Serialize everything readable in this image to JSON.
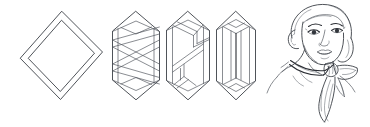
{
  "illustration": {
    "title": "Scarf folding instructions",
    "subject": "square silk scarf folded and worn as a neckerchief",
    "style": "black and white line art / technical fashion sketch",
    "background_color": "#ffffff",
    "line_color": "#3b3f46",
    "accent_line_color": "#2a2d33",
    "canvas": {
      "width": 370,
      "height": 127
    }
  },
  "steps": [
    {
      "index": 1,
      "name": "flat-square-scarf",
      "label": "Flat scarf",
      "description": "Square scarf laid flat and rotated 45 degrees into a diamond, showing the rolled hem as a second inner outline",
      "shape": "diamond",
      "bbox": {
        "x": 20,
        "y": 11,
        "width": 83,
        "height": 89
      }
    },
    {
      "index": 2,
      "name": "first-fold",
      "label": "Fold 1",
      "description": "Opposite corners folded toward the centre forming a tall hexagon with crossing zigzag fold creases",
      "shape": "hexagon-with-crossed-folds",
      "bbox": {
        "x": 112,
        "y": 11,
        "width": 48,
        "height": 89
      }
    },
    {
      "index": 3,
      "name": "second-fold",
      "label": "Fold 2",
      "description": "Folded again lengthwise into a narrower hexagonal band with offset inner panels",
      "shape": "hexagon-narrow-band",
      "bbox": {
        "x": 166,
        "y": 11,
        "width": 44,
        "height": 89
      }
    },
    {
      "index": 4,
      "name": "third-fold",
      "label": "Fold 3",
      "description": "Rolled down to a slim strip ready to tie, shown as a narrow hexagonal column with a centre crease",
      "shape": "narrow-strip",
      "bbox": {
        "x": 216,
        "y": 11,
        "width": 40,
        "height": 89
      }
    },
    {
      "index": 5,
      "name": "worn-result",
      "label": "Worn",
      "description": "Portrait of a woman in three-quarter view wearing the folded scarf tied in a knot at the side of the neck with two hanging tails",
      "shape": "portrait",
      "bbox": {
        "x": 266,
        "y": 3,
        "width": 104,
        "height": 121
      }
    }
  ],
  "figure": {
    "name": "model-portrait",
    "view": "three-quarter left",
    "features": [
      "hair",
      "eyebrows",
      "eyes",
      "nose",
      "lips",
      "chin",
      "ear",
      "neck"
    ],
    "accessory": {
      "name": "neckerchief",
      "knot_position": "right side of neck",
      "tail_count": 2
    }
  }
}
